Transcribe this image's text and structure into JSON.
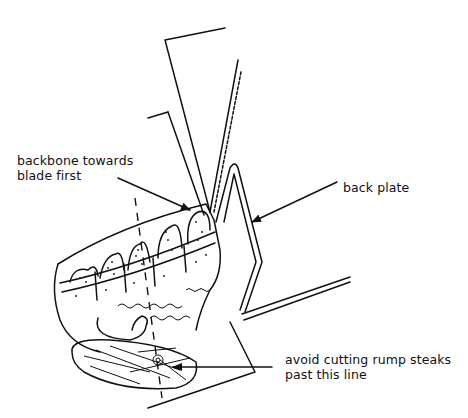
{
  "diagram": {
    "labels": {
      "backbone": {
        "line1": "backbone towards",
        "line2": "blade first"
      },
      "back_plate": {
        "text": "back plate"
      },
      "cut_limit": {
        "line1": "avoid cutting rump steaks",
        "line2": "past this line"
      }
    },
    "colors": {
      "ink": "#111111",
      "background": "#ffffff"
    }
  }
}
